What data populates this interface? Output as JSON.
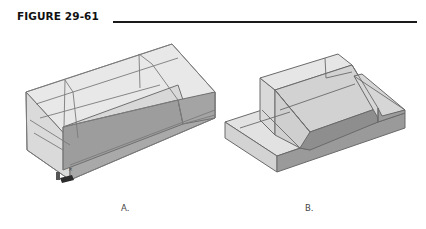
{
  "figure": {
    "title": "FIGURE 29-61",
    "rule_color": "#1a1a1a"
  },
  "panels": [
    {
      "id": "A",
      "caption": "A.",
      "description": "Transparent 3D solid model shown with hidden edges visible, with UCS axis icon at lower left",
      "ucs_icon": "ucs-axis-icon"
    },
    {
      "id": "B",
      "caption": "B.",
      "description": "Shaded 3D solid model with stepped base and sloped raised block"
    }
  ],
  "colors": {
    "edge": "#6e6e6e",
    "face_light": "#e4e4e4",
    "face_mid": "#cfcfcf",
    "face_dark": "#9a9a9a",
    "face_darker": "#8c8c8c"
  }
}
